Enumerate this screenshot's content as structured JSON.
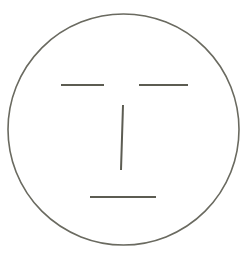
{
  "figure": {
    "type": "line-drawing",
    "stroke_color": "#5c5c52",
    "face_outline_color": "#6a6a60",
    "background": "#ffffff"
  },
  "face": {
    "outline": {
      "cx": 123.5,
      "cy": 129.5,
      "r": 115.5
    },
    "left_eye": {
      "x1": 61,
      "y1": 85,
      "x2": 104,
      "y2": 85
    },
    "right_eye": {
      "x1": 139,
      "y1": 85,
      "x2": 188,
      "y2": 85
    },
    "nose": {
      "x1": 123,
      "y1": 105,
      "x2": 121,
      "y2": 170
    },
    "mouth": {
      "x1": 90,
      "y1": 197,
      "x2": 156,
      "y2": 197
    }
  },
  "caption": {
    "text": "▬▬▬ ▬ ▬▬ ▬▬▬"
  }
}
